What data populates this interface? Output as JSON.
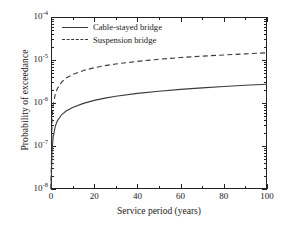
{
  "chart_data": {
    "type": "line",
    "title": "",
    "xlabel": "Service period (years)",
    "ylabel": "Probability of exceedance",
    "xlim": [
      0,
      100
    ],
    "ylim": [
      1e-08,
      0.0001
    ],
    "yscale": "log",
    "xscale": "linear",
    "grid": false,
    "legend_position": "upper-left",
    "x_ticks": [
      "0",
      "20",
      "40",
      "60",
      "80",
      "100"
    ],
    "x_tick_values": [
      0,
      20,
      40,
      60,
      80,
      100
    ],
    "y_ticks": [
      "10-8",
      "10-7",
      "10-6",
      "10-5",
      "10-4"
    ],
    "y_tick_values": [
      1e-08,
      1e-07,
      1e-06,
      1e-05,
      0.0001
    ],
    "y_tick_mantissa": [
      "10",
      "10",
      "10",
      "10",
      "10"
    ],
    "y_tick_exponent": [
      "-8",
      "-7",
      "-6",
      "-5",
      "-4"
    ],
    "minor_ticks": true,
    "x": [
      0,
      0.5,
      1,
      2,
      3,
      5,
      7,
      10,
      15,
      20,
      25,
      30,
      40,
      50,
      60,
      70,
      80,
      90,
      100
    ],
    "series": [
      {
        "name": "Cable-stayed bridge",
        "style": "solid",
        "color": "#3a3a3a",
        "values": [
          1e-08,
          8e-08,
          1.6e-07,
          2.9e-07,
          3.9e-07,
          5.4e-07,
          6.5e-07,
          7.9e-07,
          9.8e-07,
          1.15e-06,
          1.3e-06,
          1.43e-06,
          1.67e-06,
          1.88e-06,
          2.07e-06,
          2.25e-06,
          2.42e-06,
          2.58e-06,
          2.73e-06
        ]
      },
      {
        "name": "Suspension bridge",
        "style": "dashed",
        "color": "#3a3a3a",
        "values": [
          1e-08,
          4.5e-07,
          9e-07,
          1.6e-06,
          2.2e-06,
          3.1e-06,
          3.8e-06,
          4.6e-06,
          5.7e-06,
          6.6e-06,
          7.4e-06,
          8.1e-06,
          9.3e-06,
          1.04e-05,
          1.14e-05,
          1.23e-05,
          1.31e-05,
          1.39e-05,
          1.47e-05
        ]
      }
    ]
  },
  "legend": {
    "items": [
      {
        "label": "Cable-stayed bridge",
        "style": "solid"
      },
      {
        "label": "Suspension bridge",
        "style": "dashed"
      }
    ]
  }
}
